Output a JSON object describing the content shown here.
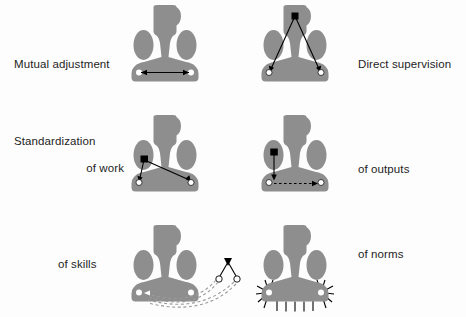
{
  "figure": {
    "background_color": "#fdfdfd",
    "org_shape_color": "#8e8e8e",
    "line_color": "#000000",
    "node_fill": "#ffffff"
  },
  "rows": [
    {
      "left": {
        "label_line1": "Mutual adjustment",
        "label_line2": "",
        "mechanism": "mutual-adjustment",
        "diagram_name": "org-shape-mutual-adjustment",
        "connector": "double-headed-arrow-across-operating-core"
      },
      "right": {
        "label_line1": "Direct supervision",
        "label_line2": "",
        "mechanism": "direct-supervision",
        "diagram_name": "org-shape-direct-supervision",
        "connector": "two-arrows-from-apex-to-operating-core"
      }
    },
    {
      "left": {
        "label_line1": "Standardization",
        "label_line2": "of work",
        "mechanism": "standardization-of-work",
        "diagram_name": "org-shape-standardization-of-work",
        "connector": "arrows-from-technostructure-to-operating-core"
      },
      "right": {
        "label_line1": "of outputs",
        "label_line2": "",
        "mechanism": "standardization-of-outputs",
        "diagram_name": "org-shape-standardization-of-outputs",
        "connector": "solid-arrow-down-and-dashed-arrow-across"
      }
    },
    {
      "left": {
        "label_line1": "of skills",
        "label_line2": "",
        "mechanism": "standardization-of-skills",
        "diagram_name": "org-shape-standardization-of-skills",
        "connector": "dashed-curves-from-external-training-unit"
      },
      "right": {
        "label_line1": "of norms",
        "label_line2": "",
        "mechanism": "standardization-of-norms",
        "diagram_name": "org-shape-standardization-of-norms",
        "connector": "radiating-spikes-from-operating-core"
      }
    }
  ]
}
